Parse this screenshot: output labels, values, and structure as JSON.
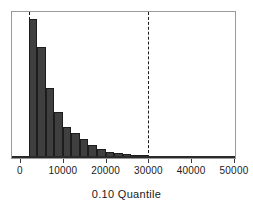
{
  "chart_data": {
    "type": "bar",
    "title": "",
    "xlabel": "0.10 Quantile",
    "ylabel": "",
    "xlim": [
      0,
      50000
    ],
    "ylim": [
      0,
      135
    ],
    "grid": false,
    "legend": null,
    "xticks": [
      0,
      10000,
      20000,
      30000,
      40000,
      50000
    ],
    "xticklabels": [
      "0",
      "10000",
      "20000",
      "30000",
      "40000",
      "50000"
    ],
    "bin_width": 2000,
    "bin_starts": [
      2000,
      4000,
      6000,
      8000,
      10000,
      12000,
      14000,
      16000,
      18000,
      20000,
      22000,
      24000,
      26000,
      28000,
      30000,
      32000,
      34000,
      36000,
      38000,
      40000,
      42000,
      44000,
      46000,
      48000
    ],
    "values": [
      129,
      103,
      65,
      43,
      29,
      23,
      18,
      12,
      8,
      6,
      5,
      4,
      3,
      2.5,
      2,
      1.6,
      1.3,
      1.1,
      1,
      0.9,
      0.8,
      0.7,
      0.6,
      0.6
    ],
    "annotations": [
      {
        "type": "vline",
        "x": 2000,
        "style": "dashed",
        "color": "#1a1a1a"
      },
      {
        "type": "vline",
        "x": 30000,
        "style": "dashed",
        "color": "#1a1a1a"
      }
    ],
    "colors": {
      "bar_fill": "#3f3f3f",
      "bar_edge": "#1d1d1d",
      "frame": "#9a9a9a",
      "axis": "#3a3a3a",
      "text": "#1a1a1a"
    }
  },
  "axis": {
    "title": "0.10 Quantile"
  }
}
